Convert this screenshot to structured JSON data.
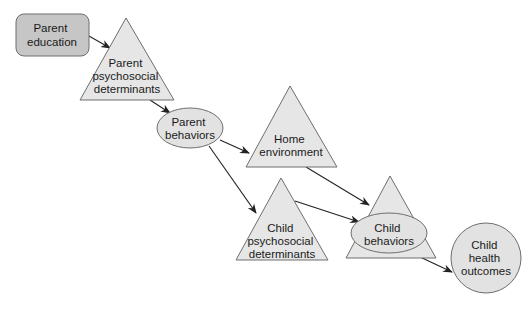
{
  "diagram": {
    "colors": {
      "box_fill": "#c6c6c6",
      "triangle_fill": "#e6e6e6",
      "ellipse_fill": "#e2e2e2",
      "stroke": "#6e6e6e",
      "arrow": "#222222"
    },
    "nodes": [
      {
        "id": "parent_education",
        "shape": "rounded-rect",
        "lines": [
          "Parent",
          "education"
        ]
      },
      {
        "id": "parent_psychosocial",
        "shape": "triangle",
        "lines": [
          "Parent",
          "psychosocial",
          "determinants"
        ]
      },
      {
        "id": "parent_behaviors",
        "shape": "ellipse",
        "lines": [
          "Parent",
          "behaviors"
        ]
      },
      {
        "id": "home_environment",
        "shape": "triangle",
        "lines": [
          "Home",
          "environment"
        ]
      },
      {
        "id": "child_psychosocial",
        "shape": "triangle",
        "lines": [
          "Child",
          "psychosocial",
          "determinants"
        ]
      },
      {
        "id": "child_behaviors",
        "shape": "triangle-with-ellipse",
        "lines": [
          "Child",
          "behaviors"
        ]
      },
      {
        "id": "child_health_outcomes",
        "shape": "circle",
        "lines": [
          "Child",
          "health",
          "outcomes"
        ]
      }
    ],
    "edges": [
      {
        "from": "parent_education",
        "to": "parent_psychosocial"
      },
      {
        "from": "parent_psychosocial",
        "to": "parent_behaviors"
      },
      {
        "from": "parent_behaviors",
        "to": "home_environment"
      },
      {
        "from": "parent_behaviors",
        "to": "child_psychosocial"
      },
      {
        "from": "home_environment",
        "to": "child_behaviors"
      },
      {
        "from": "child_psychosocial",
        "to": "child_behaviors"
      },
      {
        "from": "child_behaviors",
        "to": "child_health_outcomes"
      }
    ]
  }
}
